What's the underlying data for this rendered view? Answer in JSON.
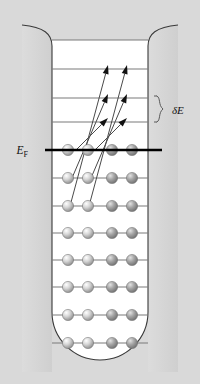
{
  "figure": {
    "type": "energy-level-diagram",
    "title": "",
    "canvas": {
      "width": 200,
      "height": 384,
      "background": "#d9d9d9"
    },
    "well": {
      "name": "potential-well",
      "fill": "#ffffff",
      "wall_fill": "#d4d4d4",
      "outline": "#3a3a3a",
      "inner_left_x": 52,
      "inner_right_x": 148,
      "top_y": 40,
      "bottom_y": 360,
      "bottom_shape": "rounded-u",
      "top_flare": "outward-curved-lip"
    },
    "labels": {
      "fermi": "E",
      "fermi_sub": "F",
      "delta": "δE"
    },
    "colors": {
      "level_line": "#7a7a7a",
      "fermi_line": "#000000",
      "sphere_light": "#d7d7d7",
      "sphere_dark": "#8f8f8f",
      "arrow": "#4a4a4a",
      "arrowhead": "#111111",
      "brace": "#5a5a5a"
    },
    "fermi_line": {
      "y": 150,
      "x_start": 45,
      "x_end": 162,
      "stroke_width": 2.6,
      "label_x": 28
    },
    "brace": {
      "name": "delta-e-brace",
      "x": 157,
      "y_top": 96,
      "y_bottom": 122,
      "label_x": 172,
      "label_y": 110
    },
    "sphere_columns": [
      68,
      88,
      112,
      132
    ],
    "sphere_radius": 5.6,
    "sphere_shades": [
      "light",
      "light",
      "dark",
      "dark"
    ],
    "levels": [
      {
        "id": "L+4",
        "y": 40,
        "occupied": false,
        "fermi": false
      },
      {
        "id": "L+3",
        "y": 69,
        "occupied": false,
        "fermi": false
      },
      {
        "id": "L+2",
        "y": 98,
        "occupied": false,
        "fermi": false
      },
      {
        "id": "L+1",
        "y": 122,
        "occupied": false,
        "fermi": false
      },
      {
        "id": "EF",
        "y": 150,
        "occupied": true,
        "fermi": true
      },
      {
        "id": "L-1",
        "y": 178,
        "occupied": true,
        "fermi": false
      },
      {
        "id": "L-2",
        "y": 206,
        "occupied": true,
        "fermi": false
      },
      {
        "id": "L-3",
        "y": 233,
        "occupied": true,
        "fermi": false
      },
      {
        "id": "L-4",
        "y": 260,
        "occupied": true,
        "fermi": false
      },
      {
        "id": "L-5",
        "y": 287,
        "occupied": true,
        "fermi": false
      },
      {
        "id": "L-6",
        "y": 315,
        "occupied": true,
        "fermi": false
      },
      {
        "id": "L-7",
        "y": 343,
        "occupied": true,
        "fermi": false
      }
    ],
    "arrows": [
      {
        "id": "a1",
        "x1": 70,
        "y1": 206,
        "x2": 108,
        "y2": 65
      },
      {
        "id": "a2",
        "x1": 89,
        "y1": 206,
        "x2": 127,
        "y2": 65
      },
      {
        "id": "a3",
        "x1": 72,
        "y1": 178,
        "x2": 108,
        "y2": 94
      },
      {
        "id": "a4",
        "x1": 91,
        "y1": 178,
        "x2": 127,
        "y2": 94
      },
      {
        "id": "a5",
        "x1": 76,
        "y1": 150,
        "x2": 108,
        "y2": 118
      },
      {
        "id": "a6",
        "x1": 95,
        "y1": 150,
        "x2": 127,
        "y2": 118
      }
    ]
  },
  "chart_data": {
    "type": "diagram",
    "annotations": [
      "E_F",
      "δE"
    ],
    "occupied_levels": 8,
    "empty_levels": 4,
    "electrons_per_level": 4,
    "excitation_arrows": 6
  }
}
